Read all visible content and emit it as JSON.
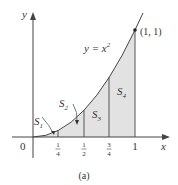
{
  "figure": {
    "caption": "(a)",
    "curve_label": "y = x",
    "curve_exponent": "2",
    "point_label": "(1, 1)",
    "x_axis_label": "x",
    "y_axis_label": "y",
    "origin_label": "0",
    "x_ticks": [
      {
        "num": "1",
        "den": "4",
        "value": 0.25
      },
      {
        "num": "1",
        "den": "2",
        "value": 0.5
      },
      {
        "num": "3",
        "den": "4",
        "value": 0.75
      },
      {
        "num": "1",
        "den": "",
        "value": 1
      }
    ],
    "regions": [
      {
        "name": "S",
        "sub": "1"
      },
      {
        "name": "S",
        "sub": "2"
      },
      {
        "name": "S",
        "sub": "3"
      },
      {
        "name": "S",
        "sub": "4"
      }
    ],
    "colors": {
      "shade": "#e2e2e2",
      "stroke": "#444444"
    }
  }
}
